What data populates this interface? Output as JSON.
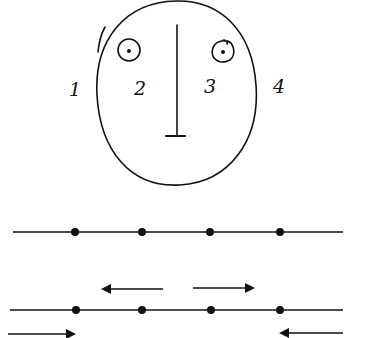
{
  "diagram": {
    "type": "hand-drawn face and number-line illustration",
    "colors": {
      "ink": "#111111",
      "background": "#ffffff"
    },
    "face": {
      "outline": {
        "cx": 176,
        "cy": 92,
        "rx": 80,
        "ry": 93
      },
      "left_eye": {
        "cx": 129,
        "cy": 50,
        "r": 11
      },
      "right_eye": {
        "cx": 223,
        "cy": 52,
        "r": 11
      },
      "nose": {
        "x": 177,
        "y1": 25,
        "y2": 135,
        "base_x1": 166,
        "base_x2": 185
      }
    },
    "labels": [
      {
        "text": "1",
        "x": 75,
        "y": 89
      },
      {
        "text": "2",
        "x": 140,
        "y": 88
      },
      {
        "text": "3",
        "x": 210,
        "y": 86
      },
      {
        "text": "4",
        "x": 279,
        "y": 86
      }
    ],
    "top_line": {
      "y": 232,
      "x1": 13,
      "x2": 343,
      "points": [
        75,
        142,
        210,
        280
      ]
    },
    "middle_arrows": [
      {
        "direction": "left",
        "x_from": 163,
        "x_to": 103,
        "y": 289
      },
      {
        "direction": "right",
        "x_from": 193,
        "x_to": 253,
        "y": 288
      }
    ],
    "bottom_line": {
      "y": 310,
      "x1": 10,
      "x2": 343,
      "points": [
        76,
        142,
        211,
        280
      ]
    },
    "bottom_arrows": [
      {
        "direction": "right",
        "x_from": 8,
        "x_to": 74,
        "y": 334
      },
      {
        "direction": "left",
        "x_from": 343,
        "x_to": 281,
        "y": 333
      }
    ]
  }
}
